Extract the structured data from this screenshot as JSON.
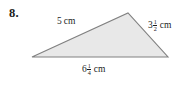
{
  "problem": {
    "number": "8."
  },
  "figure": {
    "shape_name": "triangle",
    "fill_color": "#e8e8e8",
    "stroke_color": "#808080",
    "background_color": "#ffffff",
    "vertices": [
      {
        "name": "left-vertex",
        "x": 32,
        "y": 57
      },
      {
        "name": "apex-vertex",
        "x": 128,
        "y": 13
      },
      {
        "name": "right-vertex",
        "x": 168,
        "y": 57
      }
    ]
  },
  "labels": {
    "left_side": {
      "whole": "5",
      "numerator": "",
      "denominator": "",
      "unit": "cm",
      "text": "5 cm"
    },
    "right_side": {
      "whole": "3",
      "numerator": "1",
      "denominator": "2",
      "unit": "cm",
      "text": "3 1/2 cm"
    },
    "bottom_side": {
      "whole": "6",
      "numerator": "1",
      "denominator": "4",
      "unit": "cm",
      "text": "6 1/4 cm"
    }
  }
}
